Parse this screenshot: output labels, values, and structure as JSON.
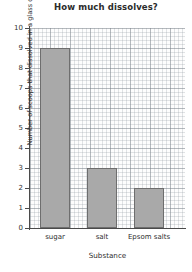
{
  "chart_data": {
    "type": "bar",
    "title": "How much dissolves?",
    "xlabel": "Substance",
    "ylabel": "Number of scoops that dissolved in a glass of water",
    "categories": [
      "sugar",
      "salt",
      "Epsom salts"
    ],
    "values": [
      9,
      3,
      2
    ],
    "ylim": [
      0,
      10
    ],
    "yticks": [
      "0",
      "1",
      "2",
      "3",
      "4",
      "5",
      "6",
      "7",
      "8",
      "9",
      "10"
    ],
    "ytick_values": [
      0,
      1,
      2,
      3,
      4,
      5,
      6,
      7,
      8,
      9,
      10
    ],
    "grid": true,
    "legend": false,
    "bar_color": "#a9a9a9",
    "bar_border_color": "#6e6e6e",
    "axis_color": "#4a4a4a",
    "grid_color": "#969ea6",
    "background": "#fdfdfd"
  }
}
